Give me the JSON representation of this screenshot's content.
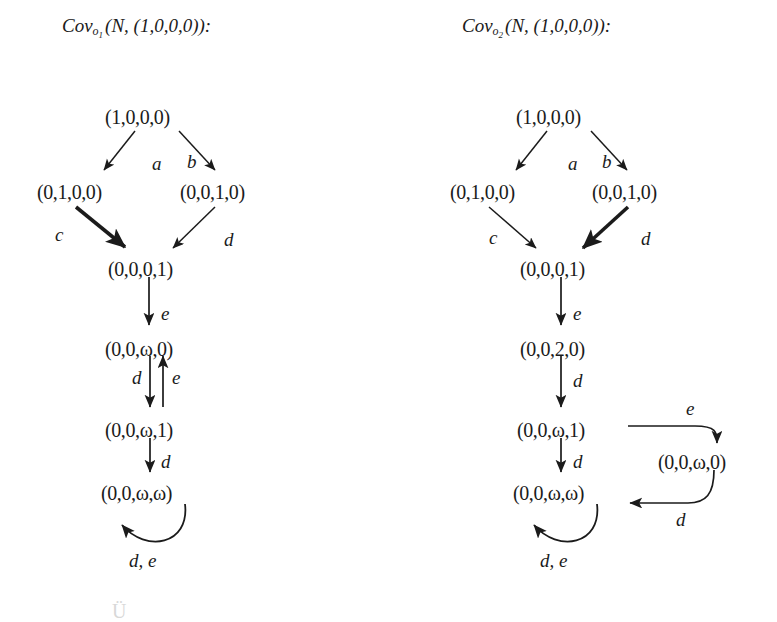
{
  "figure": {
    "background_color": "#ffffff",
    "ink_color": "#1b1b1b",
    "panels": [
      {
        "id": "left",
        "title": {
          "prefix": "Cov",
          "subscript": "o",
          "subscript_index": "1",
          "argument": "(N, (1,0,0,0)):",
          "full": "Cov_{o_1}(N,(1,0,0,0)):"
        },
        "nodes": [
          {
            "id": "L0",
            "label": "(1,0,0,0)",
            "x": 105,
            "y": 107
          },
          {
            "id": "L1",
            "label": "(0,1,0,0)",
            "x": 37,
            "y": 182
          },
          {
            "id": "L2",
            "label": "(0,0,1,0)",
            "x": 180,
            "y": 182
          },
          {
            "id": "L3",
            "label": "(0,0,0,1)",
            "x": 108,
            "y": 259
          },
          {
            "id": "L4",
            "label": "(0,0,ω,0)",
            "x": 105,
            "y": 339
          },
          {
            "id": "L5",
            "label": "(0,0,ω,1)",
            "x": 105,
            "y": 420
          },
          {
            "id": "L6",
            "label": "(0,0,ω,ω)",
            "x": 101,
            "y": 483
          }
        ],
        "edges": [
          {
            "from": "L0",
            "to": "L1",
            "label": "a",
            "bold": false,
            "kind": "diagonal"
          },
          {
            "from": "L0",
            "to": "L2",
            "label": "b",
            "bold": false,
            "kind": "diagonal"
          },
          {
            "from": "L1",
            "to": "L3",
            "label": "c",
            "bold": true,
            "kind": "diagonal"
          },
          {
            "from": "L2",
            "to": "L3",
            "label": "d",
            "bold": false,
            "kind": "diagonal"
          },
          {
            "from": "L3",
            "to": "L4",
            "label": "e",
            "bold": false,
            "kind": "vertical"
          },
          {
            "from": "L4",
            "to": "L5",
            "label": "d",
            "bold": false,
            "kind": "vertical"
          },
          {
            "from": "L5",
            "to": "L4",
            "label": "e",
            "bold": false,
            "kind": "vertical-up"
          },
          {
            "from": "L5",
            "to": "L6",
            "label": "d",
            "bold": false,
            "kind": "vertical"
          },
          {
            "from": "L6",
            "to": "L6",
            "label": "d, e",
            "bold": false,
            "kind": "self-loop"
          }
        ],
        "edge_labels": [
          {
            "text": "a",
            "x": 152,
            "y": 154
          },
          {
            "text": "b",
            "x": 187,
            "y": 152
          },
          {
            "text": "c",
            "x": 55,
            "y": 225
          },
          {
            "text": "d",
            "x": 224,
            "y": 230
          },
          {
            "text": "e",
            "x": 161,
            "y": 304
          },
          {
            "text": "d",
            "x": 132,
            "y": 370
          },
          {
            "text": "e",
            "x": 166,
            "y": 368
          },
          {
            "text": "d",
            "x": 161,
            "y": 452
          },
          {
            "text": "d, e",
            "x": 129,
            "y": 559
          }
        ]
      },
      {
        "id": "right",
        "title": {
          "prefix": "Cov",
          "subscript": "o",
          "subscript_index": "2",
          "argument": "(N, (1,0,0,0)):",
          "full": "Cov_{o_2}(N,(1,0,0,0)):"
        },
        "nodes": [
          {
            "id": "R0",
            "label": "(1,0,0,0)",
            "x": 516,
            "y": 107
          },
          {
            "id": "R1",
            "label": "(0,1,0,0)",
            "x": 450,
            "y": 182
          },
          {
            "id": "R2",
            "label": "(0,0,1,0)",
            "x": 592,
            "y": 182
          },
          {
            "id": "R3",
            "label": "(0,0,0,1)",
            "x": 520,
            "y": 259
          },
          {
            "id": "R4",
            "label": "(0,0,2,0)",
            "x": 520,
            "y": 339
          },
          {
            "id": "R5",
            "label": "(0,0,ω,1)",
            "x": 517,
            "y": 420
          },
          {
            "id": "R6",
            "label": "(0,0,ω,0)",
            "x": 658,
            "y": 452
          },
          {
            "id": "R7",
            "label": "(0,0,ω,ω)",
            "x": 513,
            "y": 483
          }
        ],
        "edges": [
          {
            "from": "R0",
            "to": "R1",
            "label": "a",
            "bold": false,
            "kind": "diagonal"
          },
          {
            "from": "R0",
            "to": "R2",
            "label": "b",
            "bold": false,
            "kind": "diagonal"
          },
          {
            "from": "R1",
            "to": "R3",
            "label": "c",
            "bold": false,
            "kind": "diagonal"
          },
          {
            "from": "R2",
            "to": "R3",
            "label": "d",
            "bold": true,
            "kind": "diagonal"
          },
          {
            "from": "R3",
            "to": "R4",
            "label": "e",
            "bold": false,
            "kind": "vertical"
          },
          {
            "from": "R4",
            "to": "R5",
            "label": "d",
            "bold": false,
            "kind": "vertical"
          },
          {
            "from": "R5",
            "to": "R6",
            "label": "e",
            "bold": false,
            "kind": "curve-right"
          },
          {
            "from": "R6",
            "to": "R7",
            "label": "d",
            "bold": false,
            "kind": "curve-left"
          },
          {
            "from": "R5",
            "to": "R7",
            "label": "d",
            "bold": false,
            "kind": "vertical"
          },
          {
            "from": "R7",
            "to": "R7",
            "label": "d, e",
            "bold": false,
            "kind": "self-loop"
          }
        ],
        "edge_labels": [
          {
            "text": "a",
            "x": 568,
            "y": 154
          },
          {
            "text": "b",
            "x": 602,
            "y": 152
          },
          {
            "text": "c",
            "x": 489,
            "y": 228
          },
          {
            "text": "d",
            "x": 641,
            "y": 229
          },
          {
            "text": "e",
            "x": 573,
            "y": 304
          },
          {
            "text": "d",
            "x": 573,
            "y": 371
          },
          {
            "text": "e",
            "x": 686,
            "y": 399
          },
          {
            "text": "d",
            "x": 676,
            "y": 518
          },
          {
            "text": "d",
            "x": 573,
            "y": 452
          },
          {
            "text": "d, e",
            "x": 540,
            "y": 559
          }
        ]
      }
    ],
    "footer_fragment": {
      "text": "Ü",
      "note": "partially cropped faint glyph at bottom-left edge",
      "x": 112,
      "y": 601
    }
  }
}
